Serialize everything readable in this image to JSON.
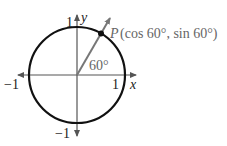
{
  "diagram": {
    "labels": {
      "y_axis": "y",
      "x_axis": "x",
      "y_pos": "1",
      "y_neg": "−1",
      "x_pos": "1",
      "x_neg": "−1",
      "angle": "60°",
      "point_P": "P",
      "point_coords": "(cos 60°, sin 60°)"
    },
    "angle_degrees": 60,
    "colors": {
      "circle": "#111111",
      "axes": "#444444",
      "ray": "#777777",
      "point": "#111111"
    }
  }
}
